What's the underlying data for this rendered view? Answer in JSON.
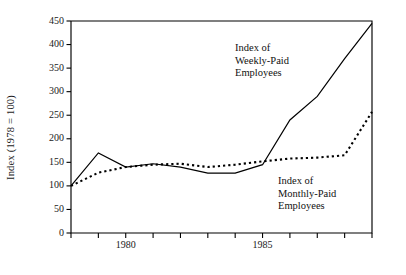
{
  "figure": {
    "background_color": "#ffffff",
    "line_color": "#000000",
    "text_color": "#111111"
  },
  "axes": {
    "y_axis_label": "Index (1978 = 100)",
    "y_ticks": [
      "0",
      "50",
      "100",
      "150",
      "200",
      "250",
      "300",
      "350",
      "400",
      "450"
    ],
    "x_ticks": [
      "",
      "",
      "1980",
      "",
      "",
      "",
      "",
      "1985",
      "",
      "",
      "",
      ""
    ]
  },
  "annotations": {
    "weekly": "Index of\nWeekly-Paid\nEmployees",
    "monthly": "Index of\nMonthly-Paid\nEmployees"
  },
  "chart_data": {
    "type": "line",
    "title": "",
    "xlabel": "",
    "ylabel": "Index (1978 = 100)",
    "ylim": [
      0,
      450
    ],
    "ytick_values": [
      0,
      50,
      100,
      150,
      200,
      250,
      300,
      350,
      400,
      450
    ],
    "xlim": [
      1978,
      1989
    ],
    "xtick_values": [
      1978,
      1979,
      1980,
      1981,
      1982,
      1983,
      1984,
      1985,
      1986,
      1987,
      1988,
      1989
    ],
    "xtick_labels": [
      "",
      "",
      "1980",
      "",
      "",
      "",
      "",
      "1985",
      "",
      "",
      "",
      ""
    ],
    "grid": false,
    "legend_position": "inline-annotations",
    "x": [
      1978,
      1979,
      1980,
      1981,
      1982,
      1983,
      1984,
      1985,
      1986,
      1987,
      1988,
      1989
    ],
    "series": [
      {
        "name": "Index of Weekly-Paid Employees",
        "style": "solid",
        "values": [
          100,
          170,
          140,
          147,
          140,
          127,
          127,
          145,
          240,
          290,
          370,
          445
        ]
      },
      {
        "name": "Index of Monthly-Paid Employees",
        "style": "dotted",
        "values": [
          100,
          128,
          140,
          145,
          147,
          140,
          145,
          152,
          158,
          160,
          165,
          257
        ]
      }
    ]
  }
}
